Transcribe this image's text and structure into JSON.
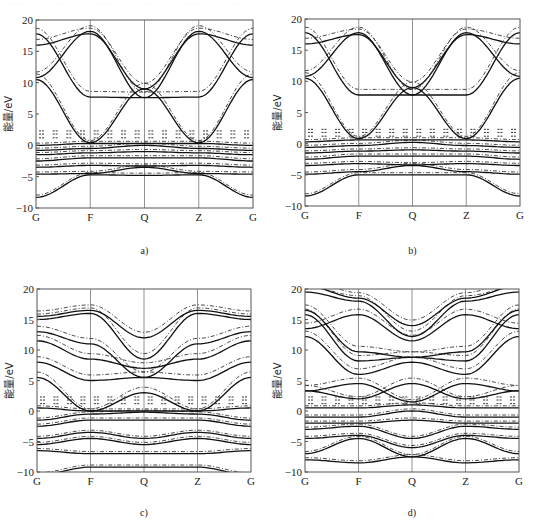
{
  "header_fragment": "…………………………………………………………………",
  "chart_data": [
    {
      "id": "a",
      "type": "line",
      "caption": "a)",
      "title": "",
      "xlabel": "",
      "ylabel": "能量/eV",
      "ylim": [
        -10,
        20
      ],
      "yticks": [
        -10,
        -5,
        0,
        5,
        10,
        15,
        20
      ],
      "xticks": [
        "G",
        "F",
        "Q",
        "Z",
        "G"
      ],
      "grid": "vertical lines at high-symmetry points",
      "series": [
        {
          "name": "band-solid",
          "style": "solid",
          "values": [
            [
              -8.3,
              -4.7,
              -4.8,
              -4.7,
              -8.3
            ]
          ]
        },
        {
          "name": "band-solid",
          "style": "solid",
          "values": [
            [
              -4.6,
              -4.5,
              -3.5,
              -4.5,
              -4.6
            ]
          ]
        },
        {
          "name": "band-solid",
          "style": "solid",
          "values": [
            [
              -3.5,
              -3.2,
              -3.3,
              -3.2,
              -3.5
            ]
          ]
        },
        {
          "name": "band-solid",
          "style": "solid",
          "values": [
            [
              -2.5,
              -2.0,
              -2.0,
              -2.0,
              -2.5
            ]
          ]
        },
        {
          "name": "band-solid",
          "style": "solid",
          "values": [
            [
              -1.5,
              -1.2,
              -1.0,
              -1.2,
              -1.5
            ]
          ]
        },
        {
          "name": "band-solid",
          "style": "solid",
          "values": [
            [
              -0.8,
              -0.5,
              0.0,
              -0.5,
              -0.8
            ]
          ]
        },
        {
          "name": "band-solid",
          "style": "solid",
          "values": [
            [
              0.0,
              0.3,
              0.3,
              0.3,
              0.0
            ]
          ]
        },
        {
          "name": "band-solid",
          "style": "solid",
          "values": [
            [
              10.5,
              0.4,
              9.0,
              0.4,
              10.5
            ]
          ]
        },
        {
          "name": "band-solid",
          "style": "solid",
          "values": [
            [
              16.0,
              17.8,
              9.0,
              17.8,
              16.0
            ]
          ]
        },
        {
          "name": "band-solid",
          "style": "solid",
          "values": [
            [
              10.8,
              18.2,
              7.6,
              18.2,
              10.8
            ]
          ]
        },
        {
          "name": "band-solid",
          "style": "solid",
          "values": [
            [
              17.8,
              7.7,
              7.6,
              7.7,
              17.8
            ]
          ]
        }
      ]
    },
    {
      "id": "b",
      "type": "line",
      "caption": "b)",
      "title": "",
      "xlabel": "",
      "ylabel": "能量/eV",
      "ylim": [
        -10,
        20
      ],
      "yticks": [
        -10,
        -5,
        0,
        5,
        10,
        15,
        20
      ],
      "xticks": [
        "G",
        "F",
        "Q",
        "Z",
        "G"
      ],
      "grid": "vertical lines at high-symmetry points",
      "series": [
        {
          "name": "band-solid",
          "style": "solid",
          "values": [
            [
              -8.4,
              -5.0,
              -5.0,
              -5.0,
              -8.4
            ]
          ]
        },
        {
          "name": "band-solid",
          "style": "solid",
          "values": [
            [
              -4.9,
              -4.5,
              -3.5,
              -4.5,
              -4.9
            ]
          ]
        },
        {
          "name": "band-solid",
          "style": "solid",
          "values": [
            [
              -3.5,
              -3.2,
              -3.4,
              -3.2,
              -3.5
            ]
          ]
        },
        {
          "name": "band-solid",
          "style": "solid",
          "values": [
            [
              -2.5,
              -2.0,
              -2.0,
              -2.0,
              -2.5
            ]
          ]
        },
        {
          "name": "band-solid",
          "style": "solid",
          "values": [
            [
              -1.5,
              -1.2,
              -1.0,
              -1.2,
              -1.5
            ]
          ]
        },
        {
          "name": "band-solid",
          "style": "solid",
          "values": [
            [
              -0.6,
              -0.3,
              0.2,
              -0.3,
              -0.6
            ]
          ]
        },
        {
          "name": "band-solid",
          "style": "solid",
          "values": [
            [
              0.3,
              0.6,
              0.6,
              0.6,
              0.3
            ]
          ]
        },
        {
          "name": "band-solid",
          "style": "solid",
          "values": [
            [
              10.5,
              0.8,
              9.0,
              0.8,
              10.5
            ]
          ]
        },
        {
          "name": "band-solid",
          "style": "solid",
          "values": [
            [
              16.0,
              17.5,
              9.0,
              17.5,
              16.0
            ]
          ]
        },
        {
          "name": "band-solid",
          "style": "solid",
          "values": [
            [
              10.8,
              17.8,
              7.8,
              17.8,
              10.8
            ]
          ]
        },
        {
          "name": "band-solid",
          "style": "solid",
          "values": [
            [
              17.8,
              7.8,
              7.8,
              7.8,
              17.8
            ]
          ]
        }
      ]
    },
    {
      "id": "c",
      "type": "line",
      "caption": "c)",
      "title": "",
      "xlabel": "",
      "ylabel": "能量/eV",
      "ylim": [
        -10,
        20
      ],
      "yticks": [
        -10,
        -5,
        0,
        5,
        10,
        15,
        20
      ],
      "xticks": [
        "G",
        "F",
        "Q",
        "Z",
        "G"
      ],
      "grid": "vertical lines at high-symmetry points",
      "series": [
        {
          "name": "band-solid",
          "style": "solid",
          "values": [
            [
              -10.5,
              -9.2,
              -9.2,
              -9.2,
              -10.5
            ]
          ]
        },
        {
          "name": "band-solid",
          "style": "solid",
          "values": [
            [
              -6.5,
              -7.0,
              -7.0,
              -7.0,
              -6.5
            ]
          ]
        },
        {
          "name": "band-solid",
          "style": "solid",
          "values": [
            [
              -5.5,
              -4.5,
              -5.5,
              -4.5,
              -5.5
            ]
          ]
        },
        {
          "name": "band-solid",
          "style": "solid",
          "values": [
            [
              -4.5,
              -3.5,
              -4.5,
              -3.5,
              -4.5
            ]
          ]
        },
        {
          "name": "band-solid",
          "style": "solid",
          "values": [
            [
              -2.5,
              -1.5,
              -1.5,
              -1.5,
              -2.5
            ]
          ]
        },
        {
          "name": "band-solid",
          "style": "solid",
          "values": [
            [
              -1.5,
              -0.5,
              -0.2,
              -0.5,
              -1.5
            ]
          ]
        },
        {
          "name": "band-solid",
          "style": "solid",
          "values": [
            [
              0.5,
              0.0,
              0.0,
              0.0,
              0.5
            ]
          ]
        },
        {
          "name": "band-solid",
          "style": "solid",
          "values": [
            [
              5.5,
              0.0,
              3.0,
              0.0,
              5.5
            ]
          ]
        },
        {
          "name": "band-solid",
          "style": "solid",
          "values": [
            [
              8.0,
              5.0,
              5.5,
              5.0,
              8.0
            ]
          ]
        },
        {
          "name": "band-solid",
          "style": "solid",
          "values": [
            [
              11.5,
              8.5,
              7.0,
              8.5,
              11.5
            ]
          ]
        },
        {
          "name": "band-solid",
          "style": "solid",
          "values": [
            [
              13.0,
              11.0,
              5.5,
              11.0,
              13.0
            ]
          ]
        },
        {
          "name": "band-solid",
          "style": "solid",
          "values": [
            [
              15.0,
              16.0,
              8.5,
              16.0,
              15.0
            ]
          ]
        },
        {
          "name": "band-solid",
          "style": "solid",
          "values": [
            [
              15.5,
              16.5,
              12.0,
              16.5,
              15.5
            ]
          ]
        }
      ]
    },
    {
      "id": "d",
      "type": "line",
      "caption": "d)",
      "title": "",
      "xlabel": "",
      "ylabel": "能量/eV",
      "ylim": [
        -10,
        20
      ],
      "yticks": [
        -10,
        -5,
        0,
        5,
        10,
        15,
        20
      ],
      "xticks": [
        "G",
        "F",
        "Q",
        "Z",
        "G"
      ],
      "grid": "vertical lines at high-symmetry points",
      "series": [
        {
          "name": "band-solid",
          "style": "solid",
          "values": [
            [
              -8.0,
              -8.5,
              -7.5,
              -8.5,
              -8.0
            ]
          ]
        },
        {
          "name": "band-solid",
          "style": "solid",
          "values": [
            [
              -7.0,
              -4.5,
              -7.5,
              -4.5,
              -7.0
            ]
          ]
        },
        {
          "name": "band-solid",
          "style": "solid",
          "values": [
            [
              -4.5,
              -4.0,
              -6.0,
              -4.0,
              -4.5
            ]
          ]
        },
        {
          "name": "band-solid",
          "style": "solid",
          "values": [
            [
              -3.0,
              -2.5,
              -4.5,
              -2.5,
              -3.0
            ]
          ]
        },
        {
          "name": "band-solid",
          "style": "solid",
          "values": [
            [
              -2.0,
              -2.0,
              -1.5,
              -2.0,
              -2.0
            ]
          ]
        },
        {
          "name": "band-solid",
          "style": "solid",
          "values": [
            [
              -1.0,
              -1.0,
              0.0,
              -1.0,
              -1.0
            ]
          ]
        },
        {
          "name": "band-solid",
          "style": "solid",
          "values": [
            [
              0.5,
              0.5,
              1.0,
              0.5,
              0.5
            ]
          ]
        },
        {
          "name": "band-solid",
          "style": "solid",
          "values": [
            [
              3.3,
              4.5,
              1.5,
              4.5,
              3.3
            ]
          ]
        },
        {
          "name": "band-solid",
          "style": "solid",
          "values": [
            [
              3.3,
              2.0,
              4.5,
              2.0,
              3.3
            ]
          ]
        },
        {
          "name": "band-solid",
          "style": "solid",
          "values": [
            [
              12.2,
              6.0,
              8.0,
              6.0,
              12.2
            ]
          ]
        },
        {
          "name": "band-solid",
          "style": "solid",
          "values": [
            [
              15.8,
              8.2,
              8.8,
              8.2,
              15.8
            ]
          ]
        },
        {
          "name": "band-solid",
          "style": "solid",
          "values": [
            [
              16.5,
              9.7,
              8.8,
              9.7,
              16.5
            ]
          ]
        },
        {
          "name": "band-solid",
          "style": "solid",
          "values": [
            [
              13.5,
              15.8,
              11.5,
              15.8,
              13.5
            ]
          ]
        },
        {
          "name": "band-solid",
          "style": "solid",
          "values": [
            [
              19.5,
              18.0,
              12.2,
              18.0,
              19.5
            ]
          ]
        },
        {
          "name": "band-solid",
          "style": "solid",
          "values": [
            [
              20.5,
              18.5,
              14.0,
              18.5,
              20.5
            ]
          ]
        }
      ]
    }
  ]
}
